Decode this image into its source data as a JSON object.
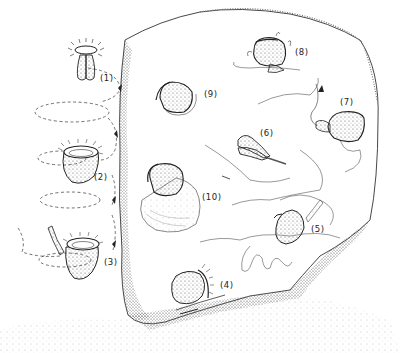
{
  "figure": {
    "type": "scientific-illustration",
    "stage_labels": [
      {
        "id": "1",
        "text": "(1)",
        "x": 100,
        "y": 80
      },
      {
        "id": "2",
        "text": "(2)",
        "x": 94,
        "y": 178
      },
      {
        "id": "3",
        "text": "(3)",
        "x": 104,
        "y": 263
      },
      {
        "id": "4",
        "text": "(4)",
        "x": 220,
        "y": 282
      },
      {
        "id": "5",
        "text": "(5)",
        "x": 311,
        "y": 225
      },
      {
        "id": "6",
        "text": "(6)",
        "x": 262,
        "y": 132
      },
      {
        "id": "7",
        "text": "(7)",
        "x": 340,
        "y": 100
      },
      {
        "id": "8",
        "text": "(8)",
        "x": 296,
        "y": 48
      },
      {
        "id": "9",
        "text": "(9)",
        "x": 206,
        "y": 91
      },
      {
        "id": "10",
        "text": "(10)",
        "x": 203,
        "y": 194
      }
    ],
    "colors": {
      "ink": "#1a1a1a",
      "stipple": "#8a8a8a",
      "background": "#ffffff"
    }
  }
}
